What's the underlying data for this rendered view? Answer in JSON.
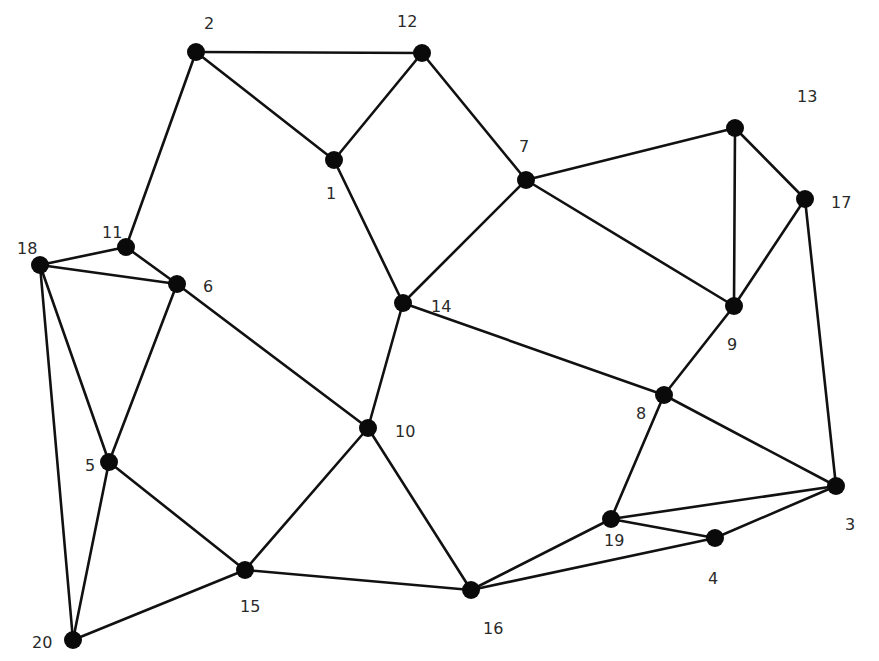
{
  "diagram": {
    "type": "undirected-graph",
    "colors": {
      "edge": "#111111",
      "node": "#0a0a0a",
      "label": "#2a2a2a",
      "background": "#ffffff"
    },
    "node_radius": 9,
    "nodes": [
      {
        "id": "1",
        "x": 334,
        "y": 160,
        "label_x": 326,
        "label_y": 199
      },
      {
        "id": "2",
        "x": 196,
        "y": 52,
        "label_x": 204,
        "label_y": 29
      },
      {
        "id": "3",
        "x": 836,
        "y": 486,
        "label_x": 845,
        "label_y": 530
      },
      {
        "id": "4",
        "x": 715,
        "y": 538,
        "label_x": 708,
        "label_y": 584
      },
      {
        "id": "5",
        "x": 109,
        "y": 462,
        "label_x": 85,
        "label_y": 471
      },
      {
        "id": "6",
        "x": 177,
        "y": 284,
        "label_x": 203,
        "label_y": 292
      },
      {
        "id": "7",
        "x": 526,
        "y": 180,
        "label_x": 519,
        "label_y": 152
      },
      {
        "id": "8",
        "x": 664,
        "y": 395,
        "label_x": 636,
        "label_y": 419
      },
      {
        "id": "9",
        "x": 734,
        "y": 306,
        "label_x": 727,
        "label_y": 350
      },
      {
        "id": "10",
        "x": 368,
        "y": 428,
        "label_x": 395,
        "label_y": 437
      },
      {
        "id": "11",
        "x": 126,
        "y": 247,
        "label_x": 102,
        "label_y": 238
      },
      {
        "id": "12",
        "x": 422,
        "y": 53,
        "label_x": 397,
        "label_y": 27
      },
      {
        "id": "13",
        "x": 735,
        "y": 128,
        "label_x": 797,
        "label_y": 102
      },
      {
        "id": "14",
        "x": 403,
        "y": 303,
        "label_x": 431,
        "label_y": 312
      },
      {
        "id": "15",
        "x": 245,
        "y": 570,
        "label_x": 240,
        "label_y": 612
      },
      {
        "id": "16",
        "x": 471,
        "y": 590,
        "label_x": 483,
        "label_y": 634
      },
      {
        "id": "17",
        "x": 805,
        "y": 199,
        "label_x": 831,
        "label_y": 208
      },
      {
        "id": "18",
        "x": 40,
        "y": 265,
        "label_x": 17,
        "label_y": 254
      },
      {
        "id": "19",
        "x": 611,
        "y": 519,
        "label_x": 604,
        "label_y": 546
      },
      {
        "id": "20",
        "x": 73,
        "y": 640,
        "label_x": 32,
        "label_y": 648
      }
    ],
    "edges": [
      [
        "2",
        "12"
      ],
      [
        "2",
        "1"
      ],
      [
        "2",
        "11"
      ],
      [
        "12",
        "1"
      ],
      [
        "12",
        "7"
      ],
      [
        "1",
        "14"
      ],
      [
        "7",
        "14"
      ],
      [
        "7",
        "13"
      ],
      [
        "7",
        "9"
      ],
      [
        "13",
        "9"
      ],
      [
        "13",
        "17"
      ],
      [
        "17",
        "9"
      ],
      [
        "17",
        "3"
      ],
      [
        "9",
        "8"
      ],
      [
        "14",
        "8"
      ],
      [
        "14",
        "10"
      ],
      [
        "8",
        "19"
      ],
      [
        "8",
        "3"
      ],
      [
        "3",
        "19"
      ],
      [
        "3",
        "4"
      ],
      [
        "19",
        "4"
      ],
      [
        "19",
        "16"
      ],
      [
        "4",
        "16"
      ],
      [
        "10",
        "6"
      ],
      [
        "10",
        "15"
      ],
      [
        "10",
        "16"
      ],
      [
        "15",
        "16"
      ],
      [
        "15",
        "5"
      ],
      [
        "15",
        "20"
      ],
      [
        "11",
        "18"
      ],
      [
        "11",
        "6"
      ],
      [
        "18",
        "6"
      ],
      [
        "18",
        "5"
      ],
      [
        "18",
        "20"
      ],
      [
        "6",
        "5"
      ],
      [
        "5",
        "20"
      ]
    ]
  }
}
